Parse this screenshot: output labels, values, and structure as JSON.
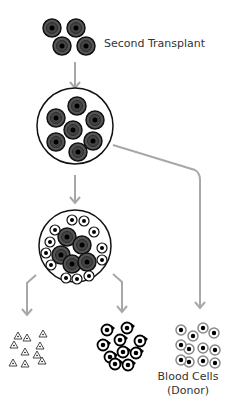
{
  "labels": {
    "second_transplant": "Second Transplant",
    "blood_cells": "Blood Cells",
    "donor": "(Donor)"
  },
  "colors": {
    "arrow": "#a8a8a8",
    "stem_cell_fill": "#555555",
    "stem_cell_dark": "#1a1a1a",
    "outline": "#111111"
  },
  "diagram": {
    "nodes": [
      {
        "id": "second-transplant-cells",
        "type": "stem-cell-cluster",
        "count": 4
      },
      {
        "id": "bone-marrow-stem-cells",
        "type": "circle-with-stem-cells",
        "count": 7
      },
      {
        "id": "bone-marrow-mixed",
        "type": "circle-with-stem-and-blood-cells",
        "stem_count": 5,
        "blood_count": 14
      },
      {
        "id": "platelets",
        "type": "triangle-cluster"
      },
      {
        "id": "white-cells",
        "type": "dark-cell-cluster"
      },
      {
        "id": "blood-cells-donor",
        "type": "blood-cell-cluster",
        "count": 12
      }
    ]
  }
}
